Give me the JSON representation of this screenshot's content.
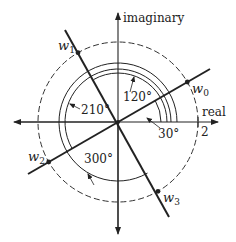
{
  "diagram": {
    "axes": {
      "horizontal_label": "real",
      "vertical_label": "imaginary",
      "tick_label": "2"
    },
    "points": [
      {
        "name": "w",
        "sub": "0",
        "angle_deg": 30
      },
      {
        "name": "w",
        "sub": "1",
        "angle_deg": 120
      },
      {
        "name": "w",
        "sub": "2",
        "angle_deg": 210
      },
      {
        "name": "w",
        "sub": "3",
        "angle_deg": 300
      }
    ],
    "angles": [
      {
        "label": "30°"
      },
      {
        "label": "120°"
      },
      {
        "label": "210°"
      },
      {
        "label": "300°"
      }
    ],
    "colors": {
      "ink": "#222222",
      "background": "#ffffff"
    }
  }
}
